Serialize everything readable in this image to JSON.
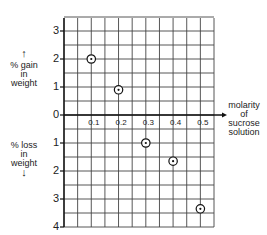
{
  "chart_data": {
    "type": "scatter",
    "title": "",
    "xlabel": "molarity of sucrose solution",
    "ylabel_positive": "% gain in weight",
    "ylabel_negative": "% loss in weight",
    "x": [
      0.1,
      0.2,
      0.3,
      0.4,
      0.5
    ],
    "values": [
      2.0,
      0.9,
      -1.0,
      -1.65,
      -3.35
    ],
    "x_ticks": [
      "0.1",
      "0.2",
      "0.3",
      "0.4",
      "0.5"
    ],
    "y_ticks_gain": [
      "3",
      "2",
      "1",
      "0"
    ],
    "y_ticks_loss": [
      "1",
      "2",
      "3",
      "4"
    ],
    "xlim": [
      0,
      0.55
    ],
    "ylim": [
      -4,
      3.5
    ],
    "grid": true,
    "legend": null
  },
  "labels": {
    "gain_line1": "% gain",
    "gain_line2": "in",
    "gain_line3": "weight",
    "loss_line1": "% loss",
    "loss_line2": "in",
    "loss_line3": "weight",
    "x_line1": "molarity",
    "x_line2": "of",
    "x_line3": "sucrose",
    "x_line4": "solution",
    "arrow_up": "↑",
    "arrow_down": "↓"
  }
}
